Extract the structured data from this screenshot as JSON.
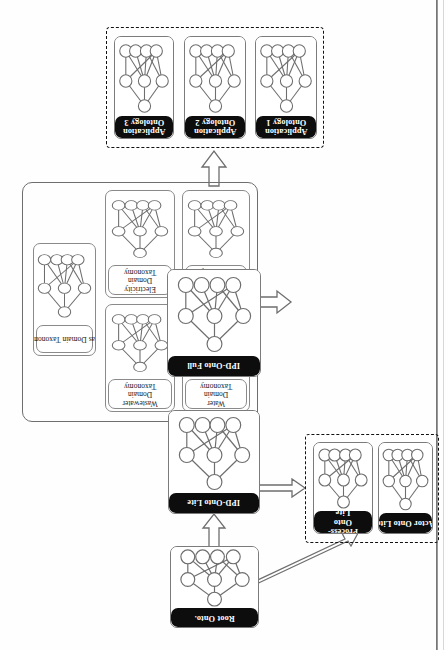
{
  "figure": {
    "type": "ontology-architecture-diagram",
    "orientation": "rotated-90-landscape-on-portrait-page",
    "colors": {
      "label_fill": "#0d0d0d",
      "label_text": "#ffffff",
      "box_stroke": "#7b7b7b",
      "group_dashed_stroke": "#111111",
      "arrow_stroke": "#6e6e6e",
      "node_stroke": "#6e6e6e",
      "background": "#ffffff"
    }
  },
  "core_chain": {
    "root": {
      "label": "Root Onto."
    },
    "lite": {
      "label": "IPD-Onto Lite"
    },
    "full": {
      "label": "IPD-Onto Full"
    }
  },
  "domain_taxonomies": {
    "items": [
      {
        "label": "Gas Domain Taxonomy"
      },
      {
        "label": "Wastewater Domain Taxonomy"
      },
      {
        "label": "Electricity Domain Taxonomy"
      },
      {
        "label": "Water Domain Taxonomy"
      },
      {
        "label": "Telecom Domain Taxonomy"
      }
    ]
  },
  "lite_extensions": {
    "items": [
      {
        "label": "Process-Onto Lite"
      },
      {
        "label": "Actor Onto Lite"
      }
    ]
  },
  "application_ontologies": {
    "items": [
      {
        "label": "Application Ontology 3"
      },
      {
        "label": "Application Ontology 2"
      },
      {
        "label": "Application Ontology 1"
      }
    ]
  },
  "arrows": [
    {
      "name": "root-to-lite",
      "style": "block",
      "heads": 1
    },
    {
      "name": "lite-to-full",
      "style": "block",
      "heads": 1
    },
    {
      "name": "taxonomies-to-full",
      "style": "block",
      "heads": 1
    },
    {
      "name": "lite-to-process-onto-lite",
      "style": "block",
      "heads": 2
    },
    {
      "name": "full-to-application-ontologies",
      "style": "block",
      "heads": 1
    },
    {
      "name": "root-to-actor-onto-lite",
      "style": "thin-outline",
      "heads": 1
    }
  ],
  "network_glyph": {
    "description": "small directed-acyclic concept graph repeated inside every ontology box",
    "nodes": 8,
    "columns": [
      1,
      3,
      4
    ]
  }
}
